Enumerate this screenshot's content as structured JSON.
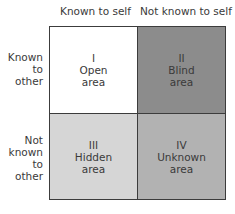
{
  "columns": [
    "Known to self",
    "Not known to self"
  ],
  "rows": [
    [
      "Known",
      "to",
      "other"
    ],
    [
      "Not",
      "known",
      "to",
      "other"
    ]
  ],
  "quadrants": [
    {
      "numeral": "I",
      "name": "Open",
      "suffix": "area",
      "color": "#ffffff"
    },
    {
      "numeral": "II",
      "name": "Blind",
      "suffix": "area",
      "color": "#8c8c8c"
    },
    {
      "numeral": "III",
      "name": "Hidden",
      "suffix": "area",
      "color": "#d6d6d6"
    },
    {
      "numeral": "IV",
      "name": "Unknown",
      "suffix": "area",
      "color": "#b2b2b2"
    }
  ]
}
